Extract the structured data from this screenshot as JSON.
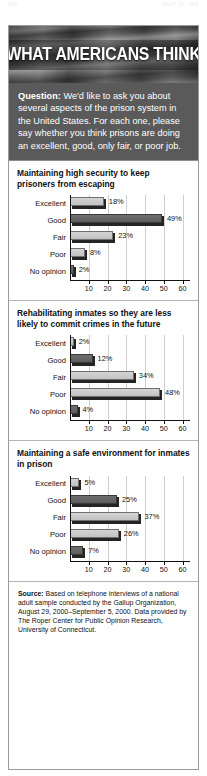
{
  "running_head": {
    "left": "500",
    "right": "PART VI · SIX"
  },
  "header": {
    "title": "WHAT AMERICANS THINK"
  },
  "question": {
    "label": "Question:",
    "text": " We'd like to ask you about several aspects of the prison system in the United States. For each one, please say whether you think prisons are doing an excellent, good, only fair, or poor job."
  },
  "charts": [
    {
      "title": "Maintaining high security to keep prisoners from escaping",
      "chart_data": {
        "type": "bar",
        "orientation": "horizontal",
        "title": "Maintaining high security to keep prisoners from escaping",
        "categories": [
          "Excellent",
          "Good",
          "Fair",
          "Poor",
          "No opinion"
        ],
        "values": [
          18,
          49,
          23,
          8,
          2
        ],
        "labels": [
          "18%",
          "49%",
          "23%",
          "8%",
          "2%"
        ],
        "xlabel": "",
        "ylabel": "",
        "xlim": [
          0,
          65
        ],
        "ticks": [
          10,
          20,
          30,
          40,
          50,
          60
        ],
        "grid": true,
        "legend": "none"
      }
    },
    {
      "title": "Rehabilitating inmates so they are less likely to commit crimes in the future",
      "chart_data": {
        "type": "bar",
        "orientation": "horizontal",
        "title": "Rehabilitating inmates so they are less likely to commit crimes in the future",
        "categories": [
          "Excellent",
          "Good",
          "Fair",
          "Poor",
          "No opinion"
        ],
        "values": [
          2,
          12,
          34,
          48,
          4
        ],
        "labels": [
          "2%",
          "12%",
          "34%",
          "48%",
          "4%"
        ],
        "xlabel": "",
        "ylabel": "",
        "xlim": [
          0,
          65
        ],
        "ticks": [
          10,
          20,
          30,
          40,
          50,
          60
        ],
        "grid": true,
        "legend": "none"
      }
    },
    {
      "title": "Maintaining a safe environment for inmates in prison",
      "chart_data": {
        "type": "bar",
        "orientation": "horizontal",
        "title": "Maintaining a safe environment for inmates in prison",
        "categories": [
          "Excellent",
          "Good",
          "Fair",
          "Poor",
          "No opinion"
        ],
        "values": [
          5,
          25,
          37,
          26,
          7
        ],
        "labels": [
          "5%",
          "25%",
          "37%",
          "26%",
          "7%"
        ],
        "xlabel": "",
        "ylabel": "",
        "xlim": [
          0,
          65
        ],
        "ticks": [
          10,
          20,
          30,
          40,
          50,
          60
        ],
        "grid": true,
        "legend": "none"
      }
    }
  ],
  "source": {
    "label": "Source:",
    "text": " Based on telephone interviews of a national adult sample conducted by the Gallup Organization, August 29, 2000–September 5, 2000. Data provided by The Roper Center for Public Opinion Research, University of Connecticut."
  },
  "colors": {
    "banner_bg": "#5d5d5d",
    "question_bg": "#5a5a5a",
    "bar_light": "#c9c9c9",
    "bar_dark": "#666666",
    "bar_shadow": "#242424",
    "grid": "#cfcfcf",
    "axis": "#111111",
    "border": "#9a9a9a"
  }
}
